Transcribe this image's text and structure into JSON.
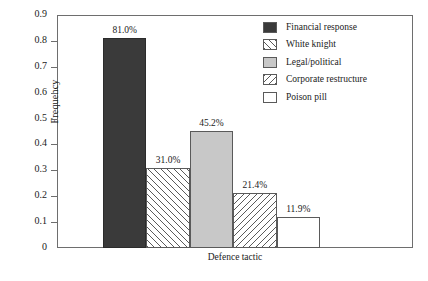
{
  "chart_data": {
    "type": "bar",
    "title": "",
    "xlabel": "Defence tactic",
    "ylabel": "Frequency",
    "categories": [
      "Financial response",
      "White knight",
      "Legal/political",
      "Corporate restructure",
      "Poison pill"
    ],
    "values": [
      0.81,
      0.31,
      0.452,
      0.214,
      0.119
    ],
    "data_labels": [
      "81.0%",
      "31.0%",
      "45.2%",
      "21.4%",
      "11.9%"
    ],
    "ylim": [
      0,
      0.9
    ],
    "yticks": [
      "0",
      "0.1",
      "0.2",
      "0.3",
      "0.4",
      "0.5",
      "0.6",
      "0.7",
      "0.8",
      "0.9"
    ],
    "ytick_values": [
      0,
      0.1,
      0.2,
      0.3,
      0.4,
      0.5,
      0.6,
      0.7,
      0.8,
      0.9
    ],
    "xticks": [],
    "grid": false,
    "legend_position": "upper right",
    "bar_styles": [
      {
        "fill": "solid-dark",
        "color": "#3a3a3a"
      },
      {
        "fill": "hatch-fwd",
        "color": "#ffffff"
      },
      {
        "fill": "solid-light",
        "color": "#c8c8c8"
      },
      {
        "fill": "hatch-back",
        "color": "#ffffff"
      },
      {
        "fill": "white",
        "color": "#ffffff"
      }
    ],
    "legend": [
      {
        "label": "Financial response",
        "fill": "solid-dark"
      },
      {
        "label": "White knight",
        "fill": "hatch-fwd"
      },
      {
        "label": "Legal/political",
        "fill": "solid-light"
      },
      {
        "label": "Corporate restructure",
        "fill": "hatch-back"
      },
      {
        "label": "Poison pill",
        "fill": "white"
      }
    ]
  },
  "colors": {
    "frame": "#6e6e6e",
    "text": "#1a1a1a",
    "bar_dark": "#3a3a3a",
    "bar_light": "#c8c8c8",
    "hatch": "#5a5a5a",
    "background": "#ffffff"
  }
}
